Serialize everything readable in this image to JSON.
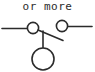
{
  "figure": {
    "caption": "or more",
    "type": "electrical-schematic-fragment",
    "background_color": "#ffffff",
    "stroke_color": "#2b2b2b",
    "canvas": {
      "width": 95,
      "height": 72
    },
    "elements": {
      "left_lead": {
        "name": "left-lead-wire",
        "x1": 2,
        "y1": 28,
        "x2": 27,
        "y2": 28
      },
      "left_terminal": {
        "name": "left-terminal-circle",
        "cx": 33,
        "cy": 28,
        "r": 6
      },
      "switch_blade": {
        "name": "switch-blade",
        "x1": 38,
        "y1": 30,
        "x2": 63,
        "y2": 40
      },
      "right_terminal": {
        "name": "right-terminal-circle",
        "cx": 62,
        "cy": 26,
        "r": 6
      },
      "right_lead": {
        "name": "right-lead-wire",
        "x1": 68,
        "y1": 27,
        "x2": 92,
        "y2": 27
      },
      "stem": {
        "name": "vertical-stem-wire",
        "x1": 43,
        "y1": 31,
        "x2": 43,
        "y2": 48
      },
      "lamp": {
        "name": "lamp-circle",
        "cx": 43,
        "cy": 59,
        "r": 11
      }
    }
  }
}
